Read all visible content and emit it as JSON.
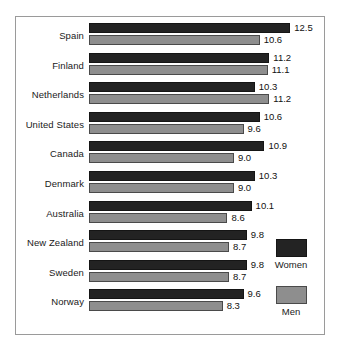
{
  "chart_data": {
    "type": "bar",
    "orientation": "horizontal",
    "title": "",
    "xlabel": "",
    "ylabel": "",
    "grid": false,
    "xlim": [
      0,
      13.2
    ],
    "legend_position": "bottom-right",
    "categories": [
      "Spain",
      "Finland",
      "Netherlands",
      "United States",
      "Canada",
      "Denmark",
      "Australia",
      "New Zealand",
      "Sweden",
      "Norway"
    ],
    "series": [
      {
        "name": "Women",
        "color": "#232323",
        "values": [
          12.5,
          11.2,
          10.3,
          10.6,
          10.9,
          10.3,
          10.1,
          9.8,
          9.8,
          9.6
        ],
        "labels": [
          "12.5",
          "11.2",
          "10.3",
          "10.6",
          "10.9",
          "10.3",
          "10.1",
          "9.8",
          "9.8",
          "9.6"
        ]
      },
      {
        "name": "Men",
        "color": "#8e8e8e",
        "values": [
          10.6,
          11.1,
          11.2,
          9.6,
          9.0,
          9.0,
          8.6,
          8.7,
          8.7,
          8.3
        ],
        "labels": [
          "10.6",
          "11.1",
          "11.2",
          "9.6",
          "9.0",
          "9.0",
          "8.6",
          "8.7",
          "8.7",
          "8.3"
        ]
      }
    ]
  },
  "legend": {
    "entries": [
      {
        "label": "Women",
        "color": "#232323"
      },
      {
        "label": "Men",
        "color": "#8e8e8e"
      }
    ]
  }
}
